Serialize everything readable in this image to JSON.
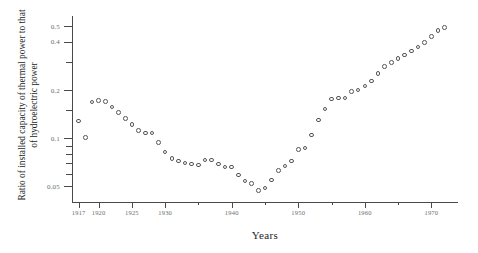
{
  "chart_data": {
    "type": "scatter",
    "title": "",
    "xlabel": "Years",
    "ylabel": "Ratio of installed capacity of thermal power to that of hydroelectric power",
    "yscale": "log",
    "ylim": [
      0.04,
      0.58
    ],
    "xlim": [
      1916,
      1974
    ],
    "grid": false,
    "legend": null,
    "marker": "open-circle",
    "y_ticks": [
      {
        "value": 0.05,
        "label": "0.05",
        "major": true
      },
      {
        "value": 0.06,
        "label": "",
        "major": false
      },
      {
        "value": 0.07,
        "label": "",
        "major": false
      },
      {
        "value": 0.08,
        "label": "",
        "major": false
      },
      {
        "value": 0.09,
        "label": "",
        "major": false
      },
      {
        "value": 0.1,
        "label": "0.1",
        "major": true
      },
      {
        "value": 0.15,
        "label": "",
        "major": false
      },
      {
        "value": 0.2,
        "label": "0.2",
        "major": true
      },
      {
        "value": 0.3,
        "label": "",
        "major": false
      },
      {
        "value": 0.4,
        "label": "0.4",
        "major": true
      },
      {
        "value": 0.5,
        "label": "0.5",
        "major": true
      }
    ],
    "x_ticks": [
      {
        "value": 1917,
        "label": "1917",
        "major": true
      },
      {
        "value": 1920,
        "label": "1920",
        "major": true
      },
      {
        "value": 1925,
        "label": "1925",
        "major": true
      },
      {
        "value": 1930,
        "label": "1930",
        "major": true
      },
      {
        "value": 1935,
        "label": "",
        "major": false
      },
      {
        "value": 1940,
        "label": "1940",
        "major": true
      },
      {
        "value": 1945,
        "label": "",
        "major": false
      },
      {
        "value": 1950,
        "label": "1950",
        "major": true
      },
      {
        "value": 1955,
        "label": "",
        "major": false
      },
      {
        "value": 1960,
        "label": "1960",
        "major": true
      },
      {
        "value": 1965,
        "label": "",
        "major": false
      },
      {
        "value": 1970,
        "label": "1970",
        "major": true
      }
    ],
    "x": [
      1917,
      1918,
      1919,
      1920,
      1921,
      1922,
      1923,
      1924,
      1925,
      1926,
      1927,
      1928,
      1929,
      1930,
      1931,
      1932,
      1933,
      1934,
      1935,
      1936,
      1937,
      1938,
      1939,
      1940,
      1941,
      1942,
      1943,
      1944,
      1945,
      1946,
      1947,
      1948,
      1949,
      1950,
      1951,
      1952,
      1953,
      1954,
      1955,
      1956,
      1957,
      1958,
      1959,
      1960,
      1961,
      1962,
      1963,
      1964,
      1965,
      1966,
      1967,
      1968,
      1969,
      1970,
      1971,
      1972
    ],
    "y": [
      0.128,
      0.101,
      0.168,
      0.172,
      0.17,
      0.157,
      0.145,
      0.133,
      0.122,
      0.112,
      0.108,
      0.108,
      0.094,
      0.082,
      0.075,
      0.072,
      0.07,
      0.069,
      0.068,
      0.073,
      0.073,
      0.069,
      0.066,
      0.066,
      0.059,
      0.054,
      0.052,
      0.047,
      0.049,
      0.055,
      0.063,
      0.067,
      0.072,
      0.085,
      0.087,
      0.105,
      0.13,
      0.152,
      0.176,
      0.178,
      0.178,
      0.196,
      0.2,
      0.212,
      0.228,
      0.253,
      0.281,
      0.296,
      0.315,
      0.332,
      0.35,
      0.372,
      0.395,
      0.432,
      0.47,
      0.492
    ],
    "axis_color": "#4a4a4a",
    "marker_color": "#55555c",
    "label_color": "#6d6d6d",
    "title_color": "#1c1c1c"
  }
}
